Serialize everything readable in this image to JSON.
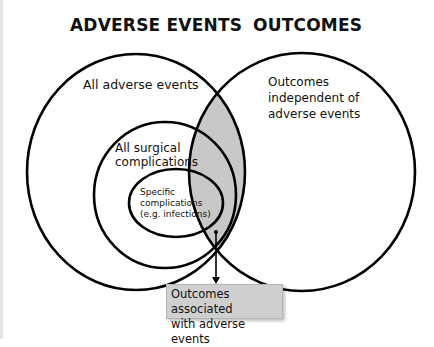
{
  "headings": {
    "left": "ADVERSE EVENTS",
    "right": "OUTCOMES"
  },
  "labels": {
    "all_adverse_events": "All adverse events",
    "all_surgical_line1": "All surgical",
    "all_surgical_line2": "complications",
    "specific_line1": "Specific",
    "specific_line2": "complications",
    "specific_line3": "(e.g. infections)",
    "independent_line1": "Outcomes",
    "independent_line2": "independent of",
    "independent_line3": "adverse events"
  },
  "callout": {
    "line1": "Outcomes associated",
    "line2": "with adverse events"
  },
  "colors": {
    "stroke": "#000000",
    "overlap_fill": "#c8c8c8",
    "box_fill": "#cfcfcf"
  }
}
